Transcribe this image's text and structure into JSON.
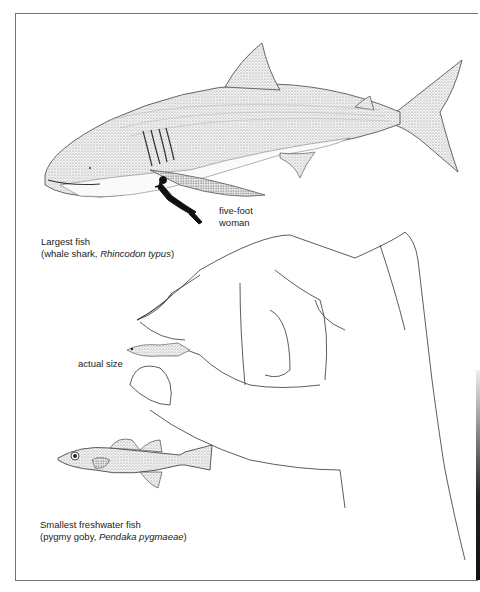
{
  "whale_shark": {
    "caption_line1": "Largest fish",
    "caption_line2_prefix": "(whale shark, ",
    "caption_line2_italic": "Rhincodon typus",
    "caption_line2_suffix": ")",
    "diver_label_line1": "five-foot",
    "diver_label_line2": "woman"
  },
  "hand": {
    "actual_size_label": "actual size"
  },
  "pygmy_goby": {
    "caption_line1": "Smallest freshwater fish",
    "caption_line2_prefix": "(pygmy goby, ",
    "caption_line2_italic": "Pendaka pygmaeae",
    "caption_line2_suffix": ")"
  }
}
